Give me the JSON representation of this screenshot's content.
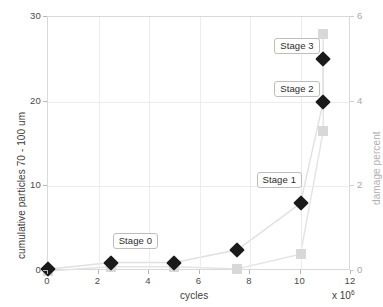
{
  "chart_data": {
    "type": "line",
    "title": "",
    "xlabel": "cycles",
    "ylabel": "cumulative particles 70 - 100 um",
    "y2label": "damage percent",
    "x_multiplier": "x 10",
    "x_multiplier_exponent": "6",
    "xlim": [
      0,
      12
    ],
    "ylim": [
      0,
      30
    ],
    "y2lim": [
      0,
      6
    ],
    "xticks": [
      "0",
      "2",
      "4",
      "6",
      "8",
      "10",
      "12"
    ],
    "yticks": [
      "0",
      "10",
      "20",
      "30"
    ],
    "y2ticks": [
      "0",
      "2",
      "4",
      "6"
    ],
    "grid": true,
    "legend": "none",
    "series": [
      {
        "name": "cumulative particles 70 - 100 um",
        "axis": "left",
        "marker": "diamond",
        "color": "#1a1a1a",
        "x": [
          0,
          2.5,
          5.0,
          7.5,
          10.0,
          10.9,
          10.9
        ],
        "y": [
          0.2,
          1.0,
          1.0,
          2.5,
          8.0,
          20.0,
          25.0
        ]
      },
      {
        "name": "damage percent",
        "axis": "right",
        "marker": "square",
        "color": "#d8d8d8",
        "x": [
          0,
          2.5,
          5.0,
          7.5,
          10.0,
          10.9,
          10.9
        ],
        "y": [
          0.0,
          0.1,
          0.1,
          0.05,
          0.4,
          3.3,
          5.6
        ]
      }
    ],
    "annotations": [
      {
        "label": "Stage 0",
        "x": 2.6,
        "y": 3.6
      },
      {
        "label": "Stage 1",
        "x": 8.3,
        "y": 10.8
      },
      {
        "label": "Stage 2",
        "x": 9.0,
        "y": 21.5
      },
      {
        "label": "Stage 3",
        "x": 9.0,
        "y": 26.6
      }
    ]
  },
  "caption": {
    "text": ""
  }
}
